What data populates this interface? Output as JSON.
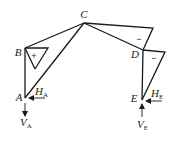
{
  "diagram": {
    "type": "frame-moment-diagram",
    "nodes": {
      "A": {
        "label": "A"
      },
      "B": {
        "label": "B"
      },
      "C": {
        "label": "C"
      },
      "D": {
        "label": "D"
      },
      "E": {
        "label": "E"
      }
    },
    "regions": {
      "left_column_sign": "+",
      "right_beam_sign": "−",
      "right_column_sign": "−"
    },
    "reactions": {
      "HA": {
        "main": "H",
        "sub": "A"
      },
      "VA": {
        "main": "V",
        "sub": "A"
      },
      "HE": {
        "main": "H",
        "sub": "E"
      },
      "VE": {
        "main": "V",
        "sub": "E"
      }
    },
    "colors": {
      "stroke": "#1a1a1a",
      "background": "#ffffff"
    }
  }
}
